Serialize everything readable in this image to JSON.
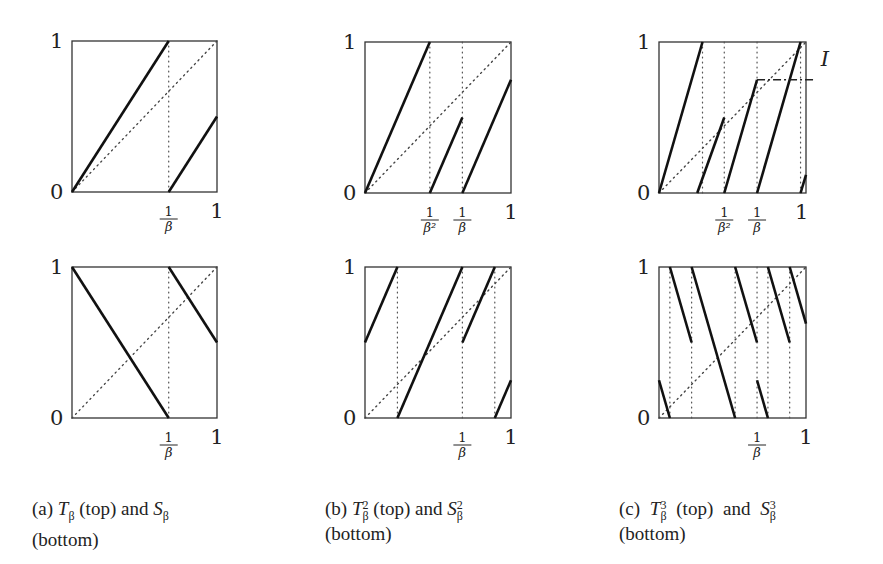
{
  "figure": {
    "beta": 1.5,
    "panels": [
      {
        "id": "a-top",
        "label": "T_beta",
        "box": {
          "x": 72,
          "y": 41,
          "w": 145,
          "h": 151
        },
        "y_ticks": [
          "0",
          "1"
        ],
        "x_ticks": [
          {
            "pos": 0.667,
            "label": "1/β"
          },
          {
            "pos": 1.0,
            "label": "1"
          }
        ],
        "vlines": [
          0.667
        ],
        "segments": [
          [
            [
              0,
              0
            ],
            [
              0.667,
              1
            ]
          ],
          [
            [
              0.667,
              0
            ],
            [
              1,
              0.5
            ]
          ]
        ],
        "dashdot": []
      },
      {
        "id": "b-top",
        "label": "T_beta^2",
        "box": {
          "x": 365,
          "y": 42,
          "w": 146,
          "h": 151
        },
        "y_ticks": [
          "0",
          "1"
        ],
        "x_ticks": [
          {
            "pos": 0.444,
            "label": "1/β²"
          },
          {
            "pos": 0.667,
            "label": "1/β"
          },
          {
            "pos": 1.0,
            "label": "1"
          }
        ],
        "vlines": [
          0.444,
          0.667
        ],
        "segments": [
          [
            [
              0,
              0
            ],
            [
              0.444,
              1
            ]
          ],
          [
            [
              0.444,
              0
            ],
            [
              0.667,
              0.5
            ]
          ],
          [
            [
              0.667,
              0
            ],
            [
              1,
              0.75
            ]
          ]
        ],
        "dashdot": []
      },
      {
        "id": "c-top",
        "label": "T_beta^3",
        "box": {
          "x": 659,
          "y": 42,
          "w": 147,
          "h": 151
        },
        "y_ticks": [
          "0",
          "1"
        ],
        "x_ticks": [
          {
            "pos": 0.444,
            "label": "1/β²"
          },
          {
            "pos": 0.667,
            "label": "1/β"
          },
          {
            "pos": 0.97,
            "label": "1"
          }
        ],
        "vlines": [
          0.296,
          0.444,
          0.667,
          0.963
        ],
        "segments": [
          [
            [
              0,
              0
            ],
            [
              0.296,
              1
            ]
          ],
          [
            [
              0.26,
              0
            ],
            [
              0.444,
              0.5
            ]
          ],
          [
            [
              0.444,
              0
            ],
            [
              0.667,
              0.75
            ]
          ],
          [
            [
              0.667,
              0
            ],
            [
              0.963,
              1
            ]
          ],
          [
            [
              0.963,
              0
            ],
            [
              1,
              0.12
            ]
          ]
        ],
        "dashdot": [
          [
            [
              0.667,
              0.75
            ],
            [
              1.05,
              0.75
            ]
          ]
        ],
        "annotation": {
          "text": "I",
          "x": 1.1,
          "y": 0.88
        }
      },
      {
        "id": "a-bottom",
        "label": "S_beta",
        "box": {
          "x": 72,
          "y": 267,
          "w": 145,
          "h": 151
        },
        "y_ticks": [
          "0",
          "1"
        ],
        "x_ticks": [
          {
            "pos": 0.667,
            "label": "1/β"
          },
          {
            "pos": 1.0,
            "label": "1"
          }
        ],
        "vlines": [
          0.667
        ],
        "segments": [
          [
            [
              0,
              1
            ],
            [
              0.667,
              0
            ]
          ],
          [
            [
              0.667,
              1
            ],
            [
              1,
              0.5
            ]
          ]
        ],
        "dashdot": []
      },
      {
        "id": "b-bottom",
        "label": "S_beta^2",
        "box": {
          "x": 365,
          "y": 267,
          "w": 146,
          "h": 151
        },
        "y_ticks": [
          "0",
          "1"
        ],
        "x_ticks": [
          {
            "pos": 0.667,
            "label": "1/β"
          },
          {
            "pos": 1.0,
            "label": "1"
          }
        ],
        "vlines": [
          0.222,
          0.667,
          0.889
        ],
        "segments": [
          [
            [
              0,
              0.5
            ],
            [
              0.222,
              1
            ]
          ],
          [
            [
              0.222,
              0
            ],
            [
              0.667,
              1
            ]
          ],
          [
            [
              0.667,
              0.5
            ],
            [
              0.889,
              1
            ]
          ],
          [
            [
              0.889,
              0
            ],
            [
              1,
              0.25
            ]
          ]
        ],
        "dashdot": []
      },
      {
        "id": "c-bottom",
        "label": "S_beta^3",
        "box": {
          "x": 659,
          "y": 267,
          "w": 147,
          "h": 151
        },
        "y_ticks": [
          "0",
          "1"
        ],
        "x_ticks": [
          {
            "pos": 0.667,
            "label": "1/β"
          },
          {
            "pos": 1.0,
            "label": "1"
          }
        ],
        "vlines": [
          0.074,
          0.222,
          0.518,
          0.667,
          0.741,
          0.889
        ],
        "segments": [
          [
            [
              0,
              0.25
            ],
            [
              0.074,
              0
            ]
          ],
          [
            [
              0.074,
              1
            ],
            [
              0.222,
              0.5
            ]
          ],
          [
            [
              0.222,
              1
            ],
            [
              0.518,
              0
            ]
          ],
          [
            [
              0.518,
              1
            ],
            [
              0.667,
              0.5
            ]
          ],
          [
            [
              0.667,
              0.25
            ],
            [
              0.741,
              0
            ]
          ],
          [
            [
              0.741,
              1
            ],
            [
              0.889,
              0.5
            ]
          ],
          [
            [
              0.889,
              1
            ],
            [
              1,
              0.625
            ]
          ]
        ],
        "dashdot": []
      }
    ]
  },
  "captions": [
    {
      "tag": "(a)",
      "sym1": "T",
      "sub1": "β",
      "sup1": "",
      "mid": "(top) and",
      "sym2": "S",
      "sub2": "β",
      "sup2": "",
      "line2": "(bottom)"
    },
    {
      "tag": "(b)",
      "sym1": "T",
      "sub1": "β",
      "sup1": "2",
      "mid": "(top) and",
      "sym2": "S",
      "sub2": "β",
      "sup2": "2",
      "line2": "(bottom)"
    },
    {
      "tag": "(c)",
      "sym1": "T",
      "sub1": "β",
      "sup1": "3",
      "mid": "(top)  and",
      "sym2": "S",
      "sub2": "β",
      "sup2": "3",
      "line2": "(bottom)"
    }
  ]
}
